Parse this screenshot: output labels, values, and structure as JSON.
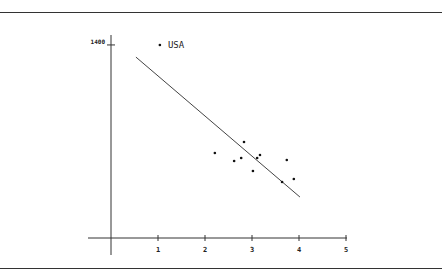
{
  "chart_data": {
    "type": "scatter",
    "title": "",
    "xlabel": "",
    "ylabel": "",
    "xlim": [
      0,
      5
    ],
    "ylim": [
      0,
      1400
    ],
    "x_ticks": [
      1,
      2,
      3,
      4,
      5
    ],
    "x_tick_labels": [
      "1",
      "2",
      "3",
      "4",
      "5"
    ],
    "y_ticks": [
      1400
    ],
    "y_tick_labels": [
      "1400"
    ],
    "grid": false,
    "legend": null,
    "series": [
      {
        "name": "observations",
        "points": [
          {
            "x": 1.04,
            "y": 1400,
            "label": "USA"
          },
          {
            "x": 2.21,
            "y": 616
          },
          {
            "x": 2.62,
            "y": 558
          },
          {
            "x": 2.77,
            "y": 580
          },
          {
            "x": 2.83,
            "y": 696
          },
          {
            "x": 3.02,
            "y": 486
          },
          {
            "x": 3.11,
            "y": 580
          },
          {
            "x": 3.17,
            "y": 602
          },
          {
            "x": 3.64,
            "y": 406
          },
          {
            "x": 3.74,
            "y": 566
          },
          {
            "x": 3.89,
            "y": 428
          }
        ]
      }
    ],
    "fit_line": {
      "type": "linear",
      "start": {
        "x": 0.53,
        "y": 1312
      },
      "end": {
        "x": 4.02,
        "y": 297
      }
    },
    "annotations": [
      {
        "text": "USA",
        "x": 1.04,
        "y": 1400
      }
    ]
  },
  "layout": {
    "plot_origin_px": {
      "x": 111,
      "y": 238
    },
    "px_per_x_unit": 47,
    "px_per_y_unit": 0.1379,
    "x_axis_extent_px": [
      88,
      347
    ],
    "y_axis_extent_px": [
      35,
      255
    ],
    "colors": {
      "axis": "#333333",
      "point": "#111111",
      "line": "#444444",
      "text": "#222222"
    }
  }
}
